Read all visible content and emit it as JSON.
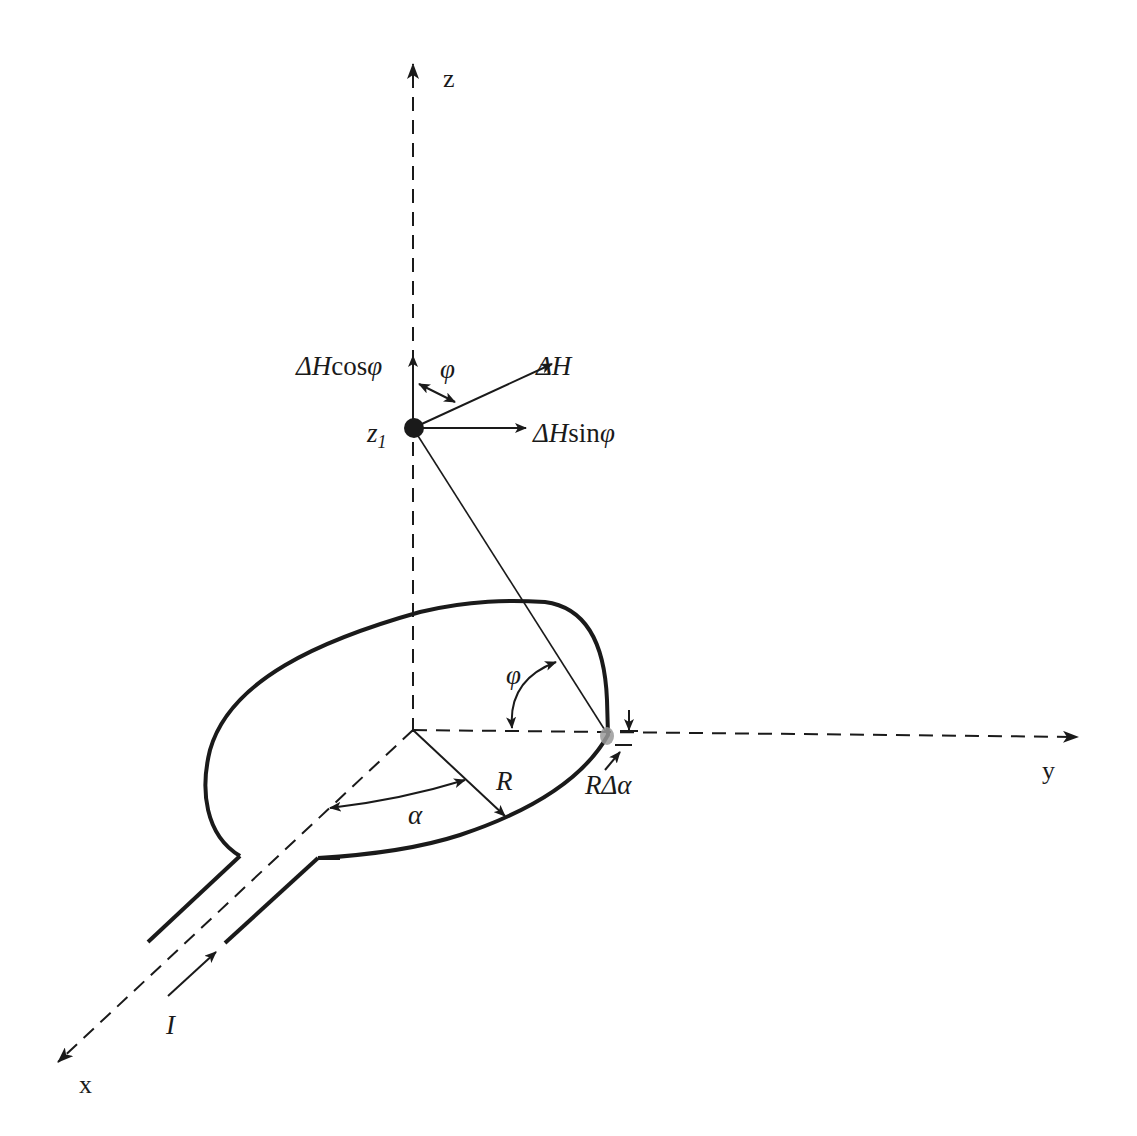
{
  "figure": {
    "colors": {
      "stroke": "#1a1a1a",
      "background": "#ffffff",
      "element_highlight": "#9a9a9a"
    }
  },
  "axes": {
    "x": {
      "label": "x"
    },
    "y": {
      "label": "y"
    },
    "z": {
      "label": "z"
    }
  },
  "labels": {
    "point": {
      "base": "z",
      "subscript": "1"
    },
    "dH": {
      "prefix": "Δ",
      "var": "H",
      "func": "",
      "angle": ""
    },
    "dH_cos": {
      "prefix": "Δ",
      "var": "H",
      "func": "cos",
      "angle": "φ"
    },
    "dH_sin": {
      "prefix": "Δ",
      "var": "H",
      "func": "sin",
      "angle": "φ"
    },
    "phi_top": "φ",
    "phi_bottom": "φ",
    "radius": "R",
    "alpha": "α",
    "arc_element": {
      "var": "R",
      "delta": "Δ",
      "angle": "α"
    },
    "current": "I"
  }
}
